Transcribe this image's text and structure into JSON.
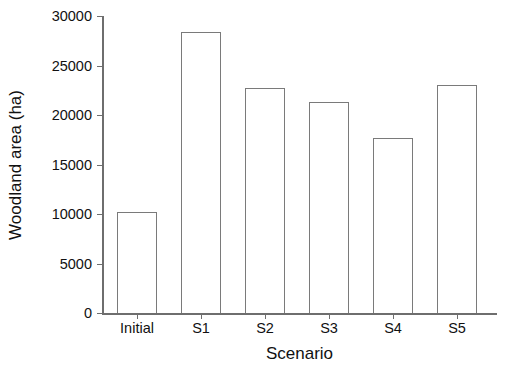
{
  "chart_data": {
    "type": "bar",
    "title": "",
    "subtitle": "",
    "xlabel": "Scenario",
    "ylabel": "Woodland area (ha)",
    "categories": [
      "Initial",
      "S1",
      "S2",
      "S3",
      "S4",
      "S5"
    ],
    "values": [
      10200,
      28400,
      22700,
      21300,
      17700,
      23000
    ],
    "series": [
      {
        "name": "Woodland area",
        "values": [
          10200,
          28400,
          22700,
          21300,
          17700,
          23000
        ]
      }
    ],
    "ylim": [
      0,
      30000
    ],
    "ytick_labels": [
      "0",
      "5000",
      "10000",
      "15000",
      "20000",
      "25000",
      "30000"
    ],
    "ytick_values": [
      0,
      5000,
      10000,
      15000,
      20000,
      25000,
      30000
    ],
    "xtick_labels": [
      "Initial",
      "S1",
      "S2",
      "S3",
      "S4",
      "S5"
    ],
    "grid": false,
    "legend": false,
    "legend_position": "none",
    "annotations": [],
    "colors": {
      "bar_fill": "#ffffff",
      "bar_edge": "#7a7a7a",
      "axis": "#6e6e6e",
      "text": "#111111",
      "background": "#ffffff"
    }
  }
}
